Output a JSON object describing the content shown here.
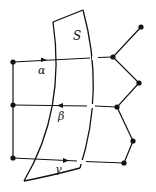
{
  "diagram": {
    "surface_label": "S",
    "paths": [
      {
        "label": "α",
        "direction": "right"
      },
      {
        "label": "β",
        "direction": "left"
      },
      {
        "label": "γ",
        "direction": "right"
      }
    ],
    "colors": {
      "stroke": "#111111",
      "background": "#ffffff"
    }
  }
}
